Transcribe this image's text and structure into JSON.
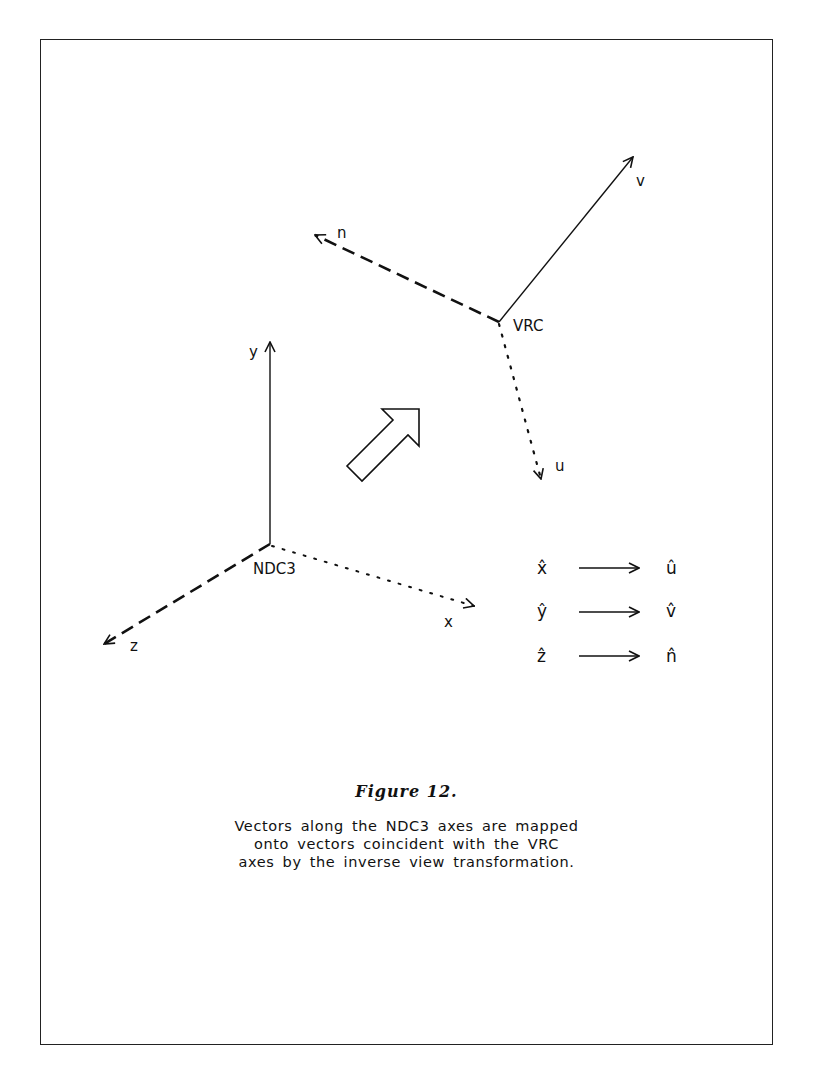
{
  "figure": {
    "title": "Figure 12.",
    "caption_lines": [
      "Vectors along the NDC3 axes are mapped",
      "onto vectors coincident with the VRC",
      "axes by the inverse view transformation."
    ]
  },
  "diagram": {
    "vrc_system": {
      "origin_label": "VRC",
      "axes": [
        {
          "name": "v",
          "label": "v",
          "style": "solid"
        },
        {
          "name": "n",
          "label": "n",
          "style": "dashed"
        },
        {
          "name": "u",
          "label": "u",
          "style": "dotted"
        }
      ]
    },
    "ndc3_system": {
      "origin_label": "NDC3",
      "axes": [
        {
          "name": "y",
          "label": "y",
          "style": "solid"
        },
        {
          "name": "z",
          "label": "z",
          "style": "dashed"
        },
        {
          "name": "x",
          "label": "x",
          "style": "dotted"
        }
      ]
    },
    "transform_arrow": {
      "icon": "outline-arrow-up-right"
    },
    "mappings": [
      {
        "from": "x̂",
        "to": "û"
      },
      {
        "from": "ŷ",
        "to": "v̂"
      },
      {
        "from": "ẑ",
        "to": "n̂"
      }
    ]
  }
}
